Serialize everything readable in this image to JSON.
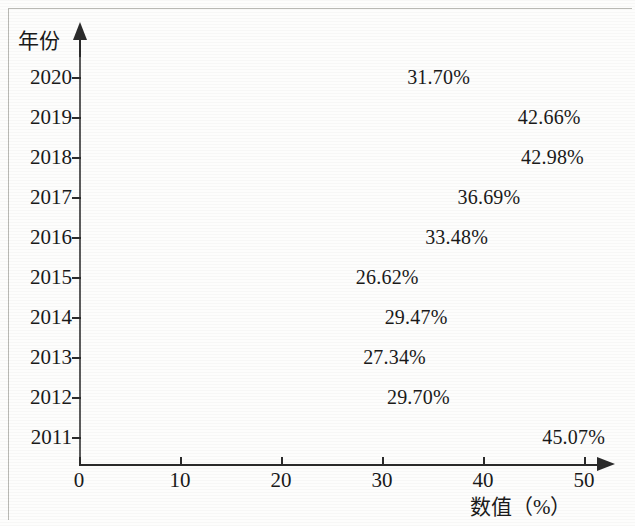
{
  "chart_data": {
    "type": "bar",
    "orientation": "horizontal",
    "title": "",
    "xlabel": "数值（%）",
    "ylabel": "年份",
    "xlim": [
      0,
      50
    ],
    "x_ticks": [
      "0",
      "10",
      "20",
      "30",
      "40",
      "50"
    ],
    "x_tick_values": [
      0,
      10,
      20,
      30,
      40,
      50
    ],
    "grid": false,
    "legend": "none",
    "categories": [
      "2020",
      "2019",
      "2018",
      "2017",
      "2016",
      "2015",
      "2014",
      "2013",
      "2012",
      "2011"
    ],
    "values": [
      31.7,
      42.66,
      42.98,
      36.69,
      33.48,
      26.62,
      29.47,
      27.34,
      29.7,
      45.07
    ],
    "value_labels": [
      "31.70%",
      "42.66%",
      "42.98%",
      "36.69%",
      "33.48%",
      "26.62%",
      "29.47%",
      "27.34%",
      "29.70%",
      "45.07%"
    ],
    "bar_colors": [
      "#8e8e8e",
      "#b3b3b3",
      "#cfcfcf",
      "#d6d6d6",
      "#e2e2e2",
      "#dcdcdc",
      "#cdcdcd",
      "#d2d2d2",
      "#a2a2a2",
      "#7d7d7d"
    ],
    "bar_border_color": "#5c5c5c",
    "axis_color": "#2b2b2b",
    "background_color": "#fdfdfc"
  },
  "bars": [
    {
      "category": "2020",
      "value": 31.7,
      "label": "31.70%",
      "color": "#8e8e8e"
    },
    {
      "category": "2019",
      "value": 42.66,
      "label": "42.66%",
      "color": "#b3b3b3"
    },
    {
      "category": "2018",
      "value": 42.98,
      "label": "42.98%",
      "color": "#cfcfcf"
    },
    {
      "category": "2017",
      "value": 36.69,
      "label": "36.69%",
      "color": "#d6d6d6"
    },
    {
      "category": "2016",
      "value": 33.48,
      "label": "33.48%",
      "color": "#e2e2e2"
    },
    {
      "category": "2015",
      "value": 26.62,
      "label": "26.62%",
      "color": "#dcdcdc"
    },
    {
      "category": "2014",
      "value": 29.47,
      "label": "29.47%",
      "color": "#cdcdcd"
    },
    {
      "category": "2013",
      "value": 27.34,
      "label": "27.34%",
      "color": "#d2d2d2"
    },
    {
      "category": "2012",
      "value": 29.7,
      "label": "29.70%",
      "color": "#a2a2a2"
    },
    {
      "category": "2011",
      "value": 45.07,
      "label": "45.07%",
      "color": "#7d7d7d"
    }
  ],
  "axes": {
    "y_title": "年份",
    "x_title": "数值（%）",
    "x_ticks": [
      "0",
      "10",
      "20",
      "30",
      "40",
      "50"
    ]
  }
}
